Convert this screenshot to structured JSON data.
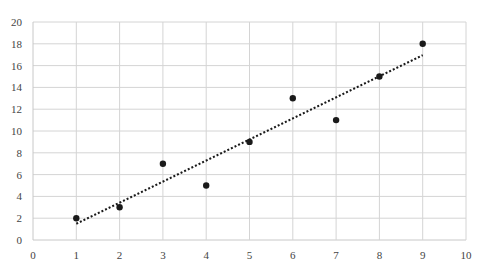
{
  "chart_data": {
    "type": "scatter",
    "title": "",
    "xlabel": "",
    "ylabel": "",
    "xlim": [
      0,
      10
    ],
    "ylim": [
      0,
      20
    ],
    "x_ticks": [
      0,
      1,
      2,
      3,
      4,
      5,
      6,
      7,
      8,
      9,
      10
    ],
    "y_ticks": [
      0,
      2,
      4,
      6,
      8,
      10,
      12,
      14,
      16,
      18,
      20
    ],
    "grid": true,
    "legend": null,
    "series": [
      {
        "name": "data",
        "x": [
          1,
          2,
          3,
          4,
          5,
          6,
          7,
          8,
          9
        ],
        "y": [
          2,
          3,
          7,
          5,
          9,
          13,
          11,
          15,
          18
        ],
        "marker_color": "#1a1a1a"
      }
    ],
    "trendline": {
      "type": "linear",
      "style": "dotted",
      "color": "#1a1a1a",
      "x_range": [
        1,
        9
      ],
      "slope": 1.933,
      "intercept": -0.444
    }
  },
  "colors": {
    "grid": "#d4d4d4",
    "marker": "#1a1a1a",
    "label": "#444444"
  }
}
